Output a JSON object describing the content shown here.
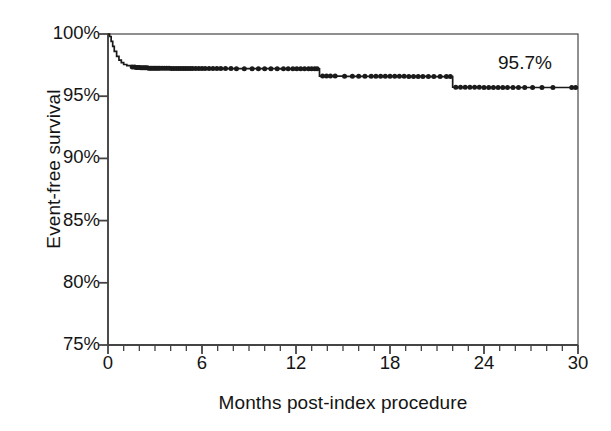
{
  "figure": {
    "background_color": "#ffffff",
    "ink_color": "#1a1a1a"
  },
  "axes": {
    "y_title": "Event-free survival",
    "x_title": "Months post-index procedure",
    "y_tick_labels": [
      "100%",
      "95%",
      "90%",
      "85%",
      "80%",
      "75%"
    ],
    "x_tick_labels": [
      "0",
      "6",
      "12",
      "18",
      "24",
      "30"
    ]
  },
  "annotations": {
    "endpoint_label": "95.7%"
  },
  "chart_data": {
    "type": "line",
    "subtype": "kaplan-meier-step",
    "title": "",
    "xlabel": "Months post-index procedure",
    "ylabel": "Event-free survival",
    "xlim": [
      0,
      30
    ],
    "ylim": [
      75,
      100
    ],
    "y_unit": "percent",
    "x_unit": "months",
    "grid": false,
    "legend": null,
    "x_major_ticks": [
      0,
      6,
      12,
      18,
      24,
      30
    ],
    "x_minor_tick_interval": 1,
    "y_major_ticks": [
      75,
      80,
      85,
      90,
      95,
      100
    ],
    "series": [
      {
        "name": "Event-free survival",
        "x": [
          0.0,
          0.1,
          0.2,
          0.3,
          0.4,
          0.55,
          0.7,
          0.85,
          1.0,
          1.2,
          1.45,
          1.75,
          2.1,
          2.6,
          3.2,
          4.0,
          5.0,
          6.5,
          8.0,
          9.5,
          11.0,
          12.5,
          13.4,
          13.5,
          15.0,
          17.0,
          19.0,
          20.5,
          21.9,
          22.0,
          24.0,
          26.0,
          28.0,
          30.0
        ],
        "y": [
          100.0,
          99.8,
          99.4,
          99.0,
          98.6,
          98.2,
          97.9,
          97.7,
          97.55,
          97.45,
          97.35,
          97.3,
          97.28,
          97.25,
          97.24,
          97.23,
          97.22,
          97.22,
          97.21,
          97.21,
          97.2,
          97.2,
          97.2,
          96.62,
          96.6,
          96.6,
          96.59,
          96.58,
          96.58,
          95.72,
          95.7,
          95.7,
          95.7,
          95.7
        ]
      }
    ],
    "step_events": [
      {
        "month": 1.5,
        "survival_after": 97.3,
        "note": "steep early drop from 100%"
      },
      {
        "month": 13.5,
        "survival_after": 96.6,
        "note": "step down"
      },
      {
        "month": 22.0,
        "survival_after": 95.7,
        "note": "step down to final value"
      }
    ],
    "final_value": 95.7,
    "censor_marks_x": [
      1.55,
      1.7,
      1.8,
      1.9,
      2.0,
      2.1,
      2.2,
      2.3,
      2.4,
      2.5,
      2.6,
      2.7,
      2.8,
      2.9,
      3.0,
      3.1,
      3.2,
      3.3,
      3.45,
      3.6,
      3.75,
      3.9,
      4.05,
      4.2,
      4.35,
      4.5,
      4.65,
      4.8,
      4.95,
      5.1,
      5.25,
      5.4,
      5.6,
      5.8,
      6.0,
      6.2,
      6.45,
      6.7,
      6.95,
      7.2,
      7.5,
      7.85,
      8.2,
      8.7,
      9.2,
      9.6,
      10.0,
      10.4,
      10.8,
      11.2,
      11.5,
      11.8,
      12.05,
      12.3,
      12.55,
      12.8,
      13.0,
      13.2,
      13.35,
      13.7,
      13.95,
      14.2,
      14.5,
      15.1,
      15.6,
      16.0,
      16.4,
      16.8,
      17.1,
      17.4,
      17.7,
      18.0,
      18.3,
      18.6,
      18.9,
      19.2,
      19.5,
      19.8,
      20.1,
      20.45,
      20.8,
      21.2,
      21.6,
      21.85,
      22.2,
      22.5,
      22.8,
      23.1,
      23.4,
      23.7,
      24.0,
      24.3,
      24.6,
      24.9,
      25.2,
      25.5,
      25.85,
      26.2,
      26.6,
      27.1,
      27.7,
      28.4,
      29.6,
      29.85
    ]
  },
  "geometry": {
    "plot_left": 108,
    "plot_right": 578,
    "plot_top": 34,
    "plot_bottom": 345
  }
}
